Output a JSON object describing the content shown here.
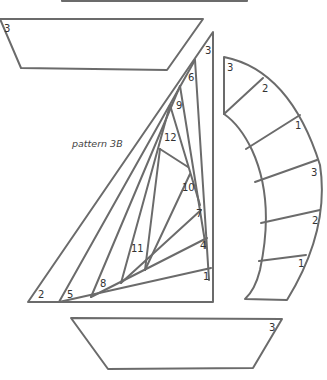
{
  "diagram": {
    "caption": "pattern 3B",
    "top_hull_piece": {
      "labels": [
        "3"
      ]
    },
    "main_sail": {
      "labels": [
        "3",
        "6",
        "9",
        "12",
        "10",
        "7",
        "4",
        "1",
        "11",
        "8",
        "5",
        "2"
      ]
    },
    "jib_sail": {
      "labels": [
        "3",
        "2",
        "1",
        "3",
        "2",
        "1"
      ]
    },
    "bottom_hull": {
      "labels": [
        "3"
      ]
    },
    "colors": {
      "line": "#6b6b6b",
      "text": "#333333",
      "background": "#ffffff"
    }
  }
}
